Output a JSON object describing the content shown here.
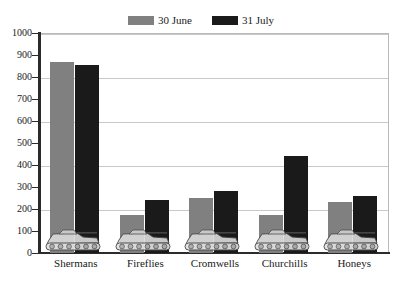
{
  "chart_data": {
    "type": "bar",
    "title": "",
    "subtitle": "",
    "xlabel": "",
    "ylabel": "",
    "ylim": [
      0,
      1000
    ],
    "ytick_step": 100,
    "yticks": [
      0,
      100,
      200,
      300,
      400,
      500,
      600,
      700,
      800,
      900,
      1000
    ],
    "gridlines": [
      200,
      400,
      600,
      800,
      1000
    ],
    "grid": true,
    "legend_position": "top-center",
    "categories": [
      "Shermans",
      "Fireflies",
      "Cromwells",
      "Churchills",
      "Honeys"
    ],
    "series": [
      {
        "name": "30 June",
        "color": "#808080",
        "values": [
          870,
          175,
          250,
          175,
          230
        ]
      },
      {
        "name": "31 July",
        "color": "#1a1a1a",
        "values": [
          855,
          240,
          280,
          440,
          260
        ]
      }
    ],
    "annotations": [
      {
        "name": "tank-silhouette",
        "category": "Shermans"
      },
      {
        "name": "tank-silhouette",
        "category": "Fireflies"
      },
      {
        "name": "tank-silhouette",
        "category": "Cromwells"
      },
      {
        "name": "tank-silhouette",
        "category": "Churchills"
      },
      {
        "name": "tank-silhouette",
        "category": "Honeys"
      }
    ]
  },
  "colors": {
    "series_june": "#808080",
    "series_july": "#1a1a1a",
    "grid": "#c9c9c9",
    "axis": "#2b2b2b",
    "background": "#ffffff",
    "text": "#1a1a1a"
  }
}
